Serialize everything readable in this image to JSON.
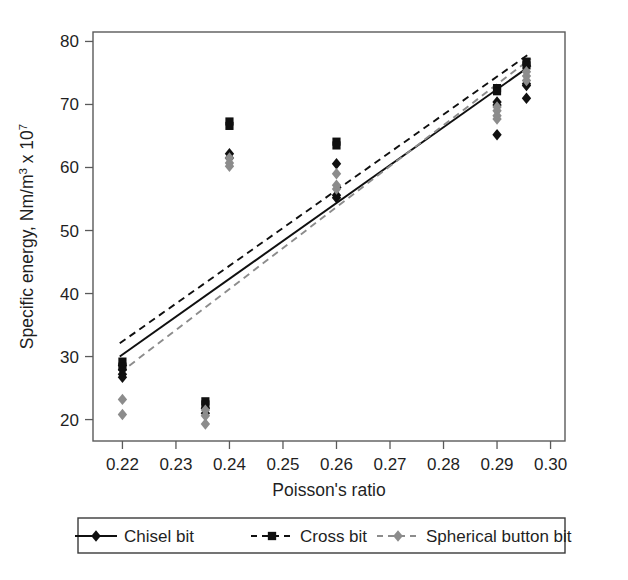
{
  "chart_data": {
    "type": "scatter",
    "title": "",
    "xlabel": "Poisson's ratio",
    "ylabel": "Specific energy, Nm/m3 x 107",
    "ylabel_main": "Specific energy, Nm/m",
    "ylabel_sup1": "3",
    "ylabel_mid": " x 10",
    "ylabel_sup2": "7",
    "xlim": [
      0.2145,
      0.3027
    ],
    "ylim": [
      16.6,
      81.5
    ],
    "xticks": [
      0.22,
      0.23,
      0.24,
      0.25,
      0.26,
      0.27,
      0.28,
      0.29,
      0.3
    ],
    "xtick_labels": [
      "0.22",
      "0.23",
      "0.24",
      "0.25",
      "0.26",
      "0.27",
      "0.28",
      "0.29",
      "0.30"
    ],
    "yticks": [
      20,
      30,
      40,
      50,
      60,
      70,
      80
    ],
    "ytick_labels": [
      "20",
      "30",
      "40",
      "50",
      "60",
      "70",
      "80"
    ],
    "grid": false,
    "legend_position": "below-axes",
    "series": [
      {
        "name": "Chisel bit",
        "marker": "diamond",
        "color": "#101010",
        "line_style": "solid",
        "points": [
          {
            "x": 0.22,
            "y": 28.6
          },
          {
            "x": 0.22,
            "y": 27.9
          },
          {
            "x": 0.22,
            "y": 27.2
          },
          {
            "x": 0.22,
            "y": 26.7
          },
          {
            "x": 0.2355,
            "y": 21.8
          },
          {
            "x": 0.2355,
            "y": 21.0
          },
          {
            "x": 0.24,
            "y": 62.2
          },
          {
            "x": 0.24,
            "y": 61.5
          },
          {
            "x": 0.26,
            "y": 60.6
          },
          {
            "x": 0.26,
            "y": 55.6
          },
          {
            "x": 0.26,
            "y": 55.2
          },
          {
            "x": 0.29,
            "y": 70.4
          },
          {
            "x": 0.29,
            "y": 69.9
          },
          {
            "x": 0.29,
            "y": 65.2
          },
          {
            "x": 0.2955,
            "y": 73.3
          },
          {
            "x": 0.2955,
            "y": 73.0
          },
          {
            "x": 0.2955,
            "y": 71.0
          }
        ],
        "trend": {
          "x1": 0.2195,
          "y1": 30.0,
          "x2": 0.2963,
          "y2": 76.2
        }
      },
      {
        "name": "Cross bit",
        "marker": "square",
        "color": "#101010",
        "line_style": "dashed",
        "points": [
          {
            "x": 0.22,
            "y": 29.2
          },
          {
            "x": 0.22,
            "y": 28.4
          },
          {
            "x": 0.2355,
            "y": 22.9
          },
          {
            "x": 0.2355,
            "y": 22.4
          },
          {
            "x": 0.24,
            "y": 67.3
          },
          {
            "x": 0.24,
            "y": 66.6
          },
          {
            "x": 0.26,
            "y": 64.1
          },
          {
            "x": 0.26,
            "y": 63.5
          },
          {
            "x": 0.29,
            "y": 72.6
          },
          {
            "x": 0.29,
            "y": 72.1
          },
          {
            "x": 0.2955,
            "y": 76.8
          },
          {
            "x": 0.2955,
            "y": 76.2
          }
        ],
        "trend": {
          "x1": 0.2195,
          "y1": 32.1,
          "x2": 0.2963,
          "y2": 78.2
        }
      },
      {
        "name": "Spherical button bit",
        "marker": "diamond",
        "color": "#8c8c8c",
        "line_style": "dashed",
        "points": [
          {
            "x": 0.22,
            "y": 23.2
          },
          {
            "x": 0.22,
            "y": 20.8
          },
          {
            "x": 0.2355,
            "y": 21.5
          },
          {
            "x": 0.2355,
            "y": 20.6
          },
          {
            "x": 0.2355,
            "y": 19.3
          },
          {
            "x": 0.24,
            "y": 61.5
          },
          {
            "x": 0.24,
            "y": 60.7
          },
          {
            "x": 0.24,
            "y": 60.2
          },
          {
            "x": 0.26,
            "y": 59.0
          },
          {
            "x": 0.26,
            "y": 57.2
          },
          {
            "x": 0.26,
            "y": 56.6
          },
          {
            "x": 0.29,
            "y": 69.6
          },
          {
            "x": 0.29,
            "y": 69.0
          },
          {
            "x": 0.29,
            "y": 68.2
          },
          {
            "x": 0.29,
            "y": 67.7
          },
          {
            "x": 0.2955,
            "y": 75.2
          },
          {
            "x": 0.2955,
            "y": 74.5
          },
          {
            "x": 0.2955,
            "y": 73.8
          }
        ],
        "trend": {
          "x1": 0.2195,
          "y1": 27.4,
          "x2": 0.2963,
          "y2": 77.3
        }
      }
    ]
  },
  "legend": {
    "items": [
      {
        "label": "Chisel bit",
        "marker": "diamond",
        "color": "#101010",
        "line_style": "solid"
      },
      {
        "label": "Cross bit",
        "marker": "square",
        "color": "#101010",
        "line_style": "dashed"
      },
      {
        "label": "Spherical button bit",
        "marker": "diamond",
        "color": "#8c8c8c",
        "line_style": "dashed"
      }
    ]
  },
  "colors": {
    "chisel": "#101010",
    "cross": "#101010",
    "spherical": "#8c8c8c",
    "frame": "#5a5a5a",
    "text": "#1f1f1f"
  }
}
